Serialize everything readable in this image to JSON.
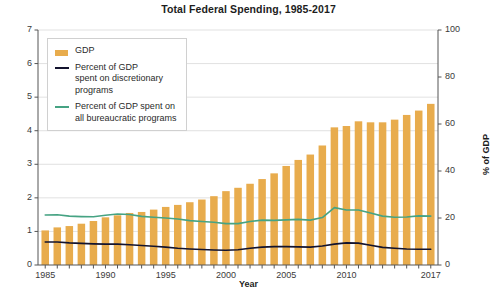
{
  "chart_data": {
    "type": "bar",
    "title": "Total Federal Spending, 1985-2017",
    "xlabel": "Year",
    "ylabel": "$ Trillion",
    "ylabel_right": "% of GDP",
    "xlim": [
      1984.4,
      2017.6
    ],
    "ylim": [
      0,
      7
    ],
    "ylim_right": [
      0,
      100
    ],
    "grid": true,
    "legend_position": "upper-left-inside",
    "x": [
      1985,
      1986,
      1987,
      1988,
      1989,
      1990,
      1991,
      1992,
      1993,
      1994,
      1995,
      1996,
      1997,
      1998,
      1999,
      2000,
      2001,
      2002,
      2003,
      2004,
      2005,
      2006,
      2007,
      2008,
      2009,
      2010,
      2011,
      2012,
      2013,
      2014,
      2015,
      2016,
      2017
    ],
    "categories": [
      "1985",
      "1986",
      "1987",
      "1988",
      "1989",
      "1990",
      "1991",
      "1992",
      "1993",
      "1994",
      "1995",
      "1996",
      "1997",
      "1998",
      "1999",
      "2000",
      "2001",
      "2002",
      "2003",
      "2004",
      "2005",
      "2006",
      "2007",
      "2008",
      "2009",
      "2010",
      "2011",
      "2012",
      "2013",
      "2014",
      "2015",
      "2016",
      "2017"
    ],
    "xticks": [
      1985,
      1990,
      1995,
      2000,
      2005,
      2010,
      2017
    ],
    "xticklabels": [
      "1985",
      "1990",
      "1995",
      "2000",
      "2005",
      "2010",
      "2017"
    ],
    "yticks_left": [
      0,
      1,
      2,
      3,
      4,
      5,
      6,
      7
    ],
    "yticklabels_left": [
      "0",
      "1",
      "2",
      "3",
      "4",
      "5",
      "6",
      "7"
    ],
    "yticks_right": [
      0,
      20,
      40,
      60,
      80,
      100
    ],
    "yticklabels_right": [
      "0",
      "20",
      "40",
      "60",
      "80",
      "100"
    ],
    "series": [
      {
        "name": "GDP",
        "type": "bar",
        "axis": "left",
        "unit": "$ Trillion",
        "color": "#e8ac4d",
        "values": [
          1.03,
          1.12,
          1.16,
          1.23,
          1.31,
          1.42,
          1.48,
          1.55,
          1.58,
          1.65,
          1.73,
          1.79,
          1.87,
          1.95,
          2.05,
          2.2,
          2.3,
          2.42,
          2.56,
          2.73,
          2.95,
          3.13,
          3.29,
          3.56,
          4.1,
          4.14,
          4.28,
          4.25,
          4.25,
          4.33,
          4.47,
          4.6,
          4.8
        ]
      },
      {
        "name": "Percent of GDP\nspent on discretionary\nprograms",
        "type": "line",
        "axis": "right",
        "unit": "% of GDP",
        "color": "#13132e",
        "values": [
          9.8,
          9.8,
          9.4,
          9.2,
          9.0,
          8.9,
          8.9,
          8.6,
          8.3,
          8.0,
          7.6,
          7.1,
          6.8,
          6.6,
          6.4,
          6.3,
          6.5,
          7.1,
          7.6,
          7.8,
          7.8,
          7.7,
          7.6,
          8.1,
          8.9,
          9.4,
          9.3,
          8.4,
          7.5,
          7.1,
          6.8,
          6.7,
          6.7
        ]
      },
      {
        "name": "Percent of GDP spent on\nall bureaucratic programs",
        "type": "line",
        "axis": "right",
        "unit": "% of GDP",
        "color": "#46a383",
        "values": [
          21.3,
          21.4,
          20.8,
          20.6,
          20.5,
          21.2,
          21.7,
          21.5,
          20.7,
          20.3,
          20.0,
          19.6,
          18.9,
          18.5,
          18.2,
          17.6,
          17.6,
          18.5,
          19.1,
          19.0,
          19.2,
          19.4,
          19.1,
          20.2,
          24.4,
          23.4,
          23.4,
          22.1,
          20.8,
          20.3,
          20.4,
          20.9,
          20.8
        ]
      }
    ],
    "legend": [
      {
        "label": "GDP",
        "marker": "bar",
        "color": "#e8ac4d"
      },
      {
        "label": "Percent of GDP\nspent on discretionary\nprograms",
        "marker": "line",
        "color": "#13132e"
      },
      {
        "label": "Percent of GDP spent on\nall bureaucratic programs",
        "marker": "line",
        "color": "#46a383"
      }
    ]
  }
}
